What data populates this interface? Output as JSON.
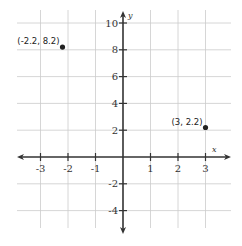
{
  "chart_data": {
    "type": "scatter",
    "title": "",
    "xlabel": "x",
    "ylabel": "y",
    "xlim": [
      -3.8,
      3.9
    ],
    "ylim": [
      -4.8,
      10.8
    ],
    "grid": true,
    "legend": null,
    "x_ticks": [
      -3,
      -2,
      -1,
      1,
      2,
      3
    ],
    "y_ticks": [
      10,
      8,
      6,
      4,
      2,
      -2,
      -4
    ],
    "x_tick_labels": [
      "-3",
      "-2",
      "-1",
      "1",
      "2",
      "3"
    ],
    "y_tick_labels": [
      "10",
      "8",
      "6",
      "4",
      "2",
      "-2",
      "-4"
    ],
    "points": [
      {
        "x": -2.2,
        "y": 8.2,
        "label": "(-2.2, 8.2)"
      },
      {
        "x": 3,
        "y": 2.2,
        "label": "(3, 2.2)"
      }
    ]
  },
  "colors": {
    "axis": "#333333",
    "grid": "#cccccc",
    "point": "#222222"
  }
}
